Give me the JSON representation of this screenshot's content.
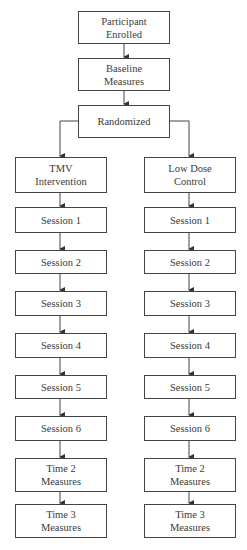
{
  "diagram": {
    "type": "flowchart",
    "top_nodes": [
      {
        "id": "enrolled",
        "lines": [
          "Participant",
          "Enrolled"
        ]
      },
      {
        "id": "baseline",
        "lines": [
          "Baseline",
          "Measures"
        ]
      },
      {
        "id": "randomized",
        "lines": [
          "Randomized"
        ]
      }
    ],
    "branches": [
      {
        "id": "tmv",
        "header": [
          "TMV",
          "Intervention"
        ],
        "steps": [
          "Session 1",
          "Session 2",
          "Session 3",
          "Session 4",
          "Session 5",
          "Session 6"
        ],
        "time2": [
          "Time 2",
          "Measures"
        ],
        "time3": [
          "Time 3",
          "Measures"
        ]
      },
      {
        "id": "control",
        "header": [
          "Low Dose",
          "Control"
        ],
        "steps": [
          "Session 1",
          "Session 2",
          "Session 3",
          "Session 4",
          "Session 5",
          "Session 6"
        ],
        "time2": [
          "Time 2",
          "Measures"
        ],
        "time3": [
          "Time 3",
          "Measures"
        ]
      }
    ],
    "edges": [
      [
        "Participant Enrolled",
        "Baseline Measures"
      ],
      [
        "Baseline Measures",
        "Randomized"
      ],
      [
        "Randomized",
        "TMV Intervention"
      ],
      [
        "Randomized",
        "Low Dose Control"
      ],
      [
        "TMV Intervention",
        "Session 1"
      ],
      [
        "Session 1",
        "Session 2"
      ],
      [
        "Session 2",
        "Session 3"
      ],
      [
        "Session 3",
        "Session 4"
      ],
      [
        "Session 4",
        "Session 5"
      ],
      [
        "Session 5",
        "Session 6"
      ],
      [
        "Session 6",
        "Time 2 Measures"
      ],
      [
        "Time 2 Measures",
        "Time 3 Measures"
      ],
      [
        "Low Dose Control",
        "Session 1"
      ]
    ],
    "colors": {
      "stroke": "#444444",
      "text": "#3a3a3a",
      "background": "#ffffff"
    }
  }
}
